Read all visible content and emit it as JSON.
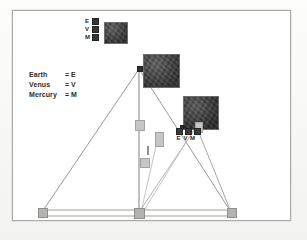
{
  "figure": {
    "type": "astronomical-triangulation-diagram",
    "background_color": "#ffffff",
    "frame_color": "#a9a9a7"
  },
  "legend": {
    "rows": [
      {
        "name": "Earth",
        "equals": "=",
        "symbol": "E"
      },
      {
        "name": "Venus",
        "equals": "=",
        "symbol": "V"
      },
      {
        "name": "Mercury",
        "equals": "=",
        "symbol": "M"
      }
    ]
  },
  "key_cluster_top": {
    "orientation": "vertical",
    "items": [
      {
        "letter": "E"
      },
      {
        "letter": "V"
      },
      {
        "letter": "M"
      }
    ]
  },
  "key_cluster_right": {
    "orientation": "horizontal",
    "items": [
      {
        "letter": "E"
      },
      {
        "letter": "V"
      },
      {
        "letter": "M"
      }
    ]
  },
  "photo_patches": [
    {
      "id": "patch-top-left",
      "x": 104,
      "y": 22,
      "w": 22,
      "h": 20,
      "tone": "dark"
    },
    {
      "id": "patch-apex",
      "x": 143,
      "y": 54,
      "w": 35,
      "h": 32,
      "tone": "dark"
    },
    {
      "id": "patch-right",
      "x": 183,
      "y": 96,
      "w": 34,
      "h": 32,
      "tone": "darker"
    }
  ],
  "markers": [
    {
      "id": "apex-node",
      "x": 137,
      "y": 67,
      "w": 4,
      "h": 4,
      "style": "dark-dot"
    },
    {
      "id": "mid-vertical-node",
      "x": 136,
      "y": 121,
      "w": 7,
      "h": 8,
      "style": "light"
    },
    {
      "id": "mid-right-node",
      "x": 155,
      "y": 133,
      "w": 6,
      "h": 12,
      "style": "light"
    },
    {
      "id": "mid-lower-node",
      "x": 141,
      "y": 159,
      "w": 7,
      "h": 7,
      "style": "light"
    },
    {
      "id": "right-stem-node",
      "x": 195,
      "y": 123,
      "w": 5,
      "h": 8,
      "style": "light"
    },
    {
      "id": "right-dot-node",
      "x": 180,
      "y": 126,
      "w": 2,
      "h": 2,
      "style": "dark-dot"
    },
    {
      "id": "baseline-left",
      "x": 39,
      "y": 209,
      "w": 7,
      "h": 7,
      "style": "plain"
    },
    {
      "id": "baseline-center",
      "x": 135,
      "y": 209,
      "w": 8,
      "h": 8,
      "style": "plain"
    },
    {
      "id": "baseline-right",
      "x": 228,
      "y": 209,
      "w": 7,
      "h": 7,
      "style": "plain"
    }
  ],
  "sliver": {
    "x": 147,
    "y": 146,
    "w": 2,
    "h": 9
  },
  "geometry": {
    "apex": {
      "x": 139,
      "y": 69
    },
    "baseline_left": {
      "x": 42,
      "y": 212
    },
    "baseline_center": {
      "x": 139,
      "y": 212
    },
    "baseline_right": {
      "x": 231,
      "y": 212
    },
    "right_node": {
      "x": 197,
      "y": 128
    }
  }
}
